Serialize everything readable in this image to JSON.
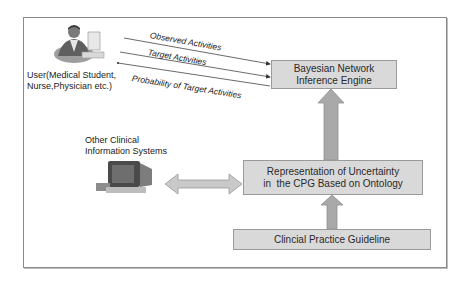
{
  "nodes": {
    "user": {
      "label_line1": "User(Medical Student,",
      "label_line2": "Nurse,Physician etc.)",
      "icon": "person-at-computer-icon"
    },
    "other_systems": {
      "label_line1": "Other Clinical",
      "label_line2": "Information Systems",
      "icon": "computer-terminal-icon"
    },
    "bayesian": {
      "label_line1": "Bayesian Network",
      "label_line2": "Inference Engine"
    },
    "representation": {
      "label_line1": "Representation of Uncertainty",
      "label_line2": "in  the CPG Based on Ontology"
    },
    "cpg": {
      "label": "Clincial Practice Guideline"
    }
  },
  "edges": [
    {
      "from": "user",
      "to": "bayesian",
      "label": "Observed Activities"
    },
    {
      "from": "user",
      "to": "bayesian",
      "label": "Target Activities"
    },
    {
      "from": "bayesian",
      "to": "user",
      "label": "Probability of Target Activities"
    },
    {
      "from": "representation",
      "to": "bayesian",
      "type": "block-arrow"
    },
    {
      "from": "cpg",
      "to": "representation",
      "type": "block-arrow"
    },
    {
      "from": "other_systems",
      "to": "representation",
      "type": "double-block-arrow"
    }
  ],
  "colors": {
    "box_fill": "#d9d9d9",
    "box_border": "#9a9a9a",
    "arrow_fill": "#a9a9a9",
    "frame_border": "#8a8a8a"
  }
}
